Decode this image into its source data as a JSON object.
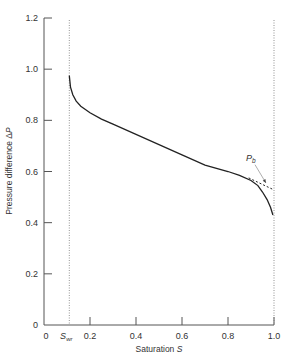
{
  "chart_data": {
    "type": "line",
    "title": "",
    "xlabel": "Saturation",
    "xlabel_var": "S",
    "ylabel": "Pressure difference Δ",
    "ylabel_var": "P",
    "xlim": [
      0,
      1.0
    ],
    "ylim": [
      0,
      1.2
    ],
    "x_ticks": [
      0,
      0.2,
      0.4,
      0.6,
      0.8,
      1.0
    ],
    "x_tick_labels": [
      "0",
      "0.2",
      "0.4",
      "0.6",
      "0.8",
      "1.0"
    ],
    "y_ticks": [
      0,
      0.2,
      0.4,
      0.6,
      0.8,
      1.0,
      1.2
    ],
    "y_tick_labels": [
      "0",
      "0.2",
      "0.4",
      "0.6",
      "0.8",
      "1.0",
      "1.2"
    ],
    "grid": false,
    "vertical_reference_lines": [
      {
        "x": 0.11,
        "label": "S",
        "label_sub": "wr",
        "style": "dotted"
      },
      {
        "x": 1.0,
        "label": "",
        "style": "dotted"
      }
    ],
    "series": [
      {
        "name": "capillary pressure curve",
        "style": "solid",
        "points": [
          [
            0.11,
            0.975
          ],
          [
            0.115,
            0.93
          ],
          [
            0.125,
            0.9
          ],
          [
            0.14,
            0.875
          ],
          [
            0.16,
            0.855
          ],
          [
            0.2,
            0.83
          ],
          [
            0.25,
            0.805
          ],
          [
            0.3,
            0.785
          ],
          [
            0.4,
            0.745
          ],
          [
            0.5,
            0.705
          ],
          [
            0.6,
            0.665
          ],
          [
            0.7,
            0.625
          ],
          [
            0.8,
            0.6
          ],
          [
            0.85,
            0.585
          ],
          [
            0.9,
            0.565
          ],
          [
            0.93,
            0.545
          ],
          [
            0.95,
            0.52
          ],
          [
            0.97,
            0.49
          ],
          [
            0.985,
            0.46
          ],
          [
            0.995,
            0.43
          ]
        ]
      },
      {
        "name": "extrapolation to Pb",
        "style": "dashed",
        "points": [
          [
            0.89,
            0.575
          ],
          [
            0.995,
            0.53
          ]
        ]
      }
    ],
    "annotations": [
      {
        "text": "P",
        "sub": "b",
        "x": 0.9,
        "y": 0.65,
        "arrow_to": [
          0.965,
          0.555
        ]
      }
    ]
  }
}
